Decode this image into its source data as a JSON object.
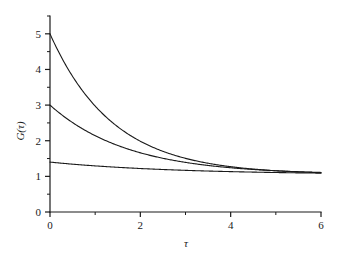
{
  "chart_data": {
    "type": "line",
    "title": "",
    "xlabel": "τ",
    "ylabel": "G(τ)",
    "xlim": [
      0,
      6
    ],
    "ylim": [
      0,
      5.5
    ],
    "grid": false,
    "legend": "none",
    "x_ticks_major": [
      0,
      2,
      4,
      6
    ],
    "x_ticks_major_labels": [
      "0",
      "2",
      "4",
      "6"
    ],
    "x_ticks_minor": [
      1,
      3,
      5
    ],
    "y_ticks_major": [
      0,
      1,
      2,
      3,
      4,
      5
    ],
    "y_ticks_major_labels": [
      "0",
      "1",
      "2",
      "3",
      "4",
      "5"
    ],
    "y_ticks_minor": [
      0.5,
      1.5,
      2.5,
      3.5,
      4.5,
      5.5
    ],
    "asymptote": 1.05,
    "series": [
      {
        "name": "curve-upper",
        "amplitude": 3.95,
        "decay_rate": 0.72,
        "baseline": 1.05,
        "x": [
          0,
          0.25,
          0.5,
          0.75,
          1,
          1.25,
          1.5,
          1.75,
          2,
          2.25,
          2.5,
          2.75,
          3,
          3.25,
          3.5,
          3.75,
          4,
          4.5,
          5,
          5.5,
          6
        ],
        "values": [
          5.0,
          4.35,
          3.8,
          3.35,
          2.97,
          2.65,
          2.39,
          2.16,
          1.98,
          1.82,
          1.7,
          1.59,
          1.5,
          1.42,
          1.36,
          1.32,
          1.28,
          1.21,
          1.16,
          1.13,
          1.11
        ]
      },
      {
        "name": "curve-middle",
        "amplitude": 1.95,
        "decay_rate": 0.58,
        "baseline": 1.05,
        "x": [
          0,
          0.25,
          0.5,
          0.75,
          1,
          1.25,
          1.5,
          1.75,
          2,
          2.25,
          2.5,
          2.75,
          3,
          3.25,
          3.5,
          3.75,
          4,
          4.5,
          5,
          5.5,
          6
        ],
        "values": [
          3.0,
          2.74,
          2.51,
          2.31,
          2.14,
          1.99,
          1.87,
          1.76,
          1.66,
          1.58,
          1.51,
          1.45,
          1.39,
          1.35,
          1.31,
          1.27,
          1.25,
          1.2,
          1.16,
          1.14,
          1.12
        ]
      },
      {
        "name": "curve-lower",
        "amplitude": 0.35,
        "decay_rate": 0.36,
        "baseline": 1.05,
        "x": [
          0,
          0.25,
          0.5,
          0.75,
          1,
          1.25,
          1.5,
          1.75,
          2,
          2.25,
          2.5,
          2.75,
          3,
          3.25,
          3.5,
          3.75,
          4,
          4.5,
          5,
          5.5,
          6
        ],
        "values": [
          1.4,
          1.37,
          1.34,
          1.32,
          1.29,
          1.27,
          1.25,
          1.24,
          1.22,
          1.2,
          1.19,
          1.18,
          1.17,
          1.16,
          1.15,
          1.14,
          1.13,
          1.12,
          1.11,
          1.1,
          1.09
        ]
      }
    ]
  },
  "colors": {
    "background": "#ffffff",
    "ink": "#1a1a1a",
    "curve": "#1a1a1a"
  }
}
